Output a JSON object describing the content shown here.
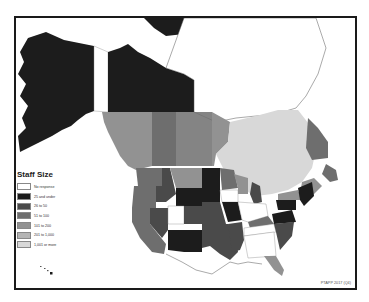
{
  "map": {
    "title": "Staff Size",
    "region": "North America (United States and Canada)",
    "credit": "PTAPP 2017 (Q4)"
  },
  "legend": {
    "title": "Staff Size",
    "items": [
      {
        "label": "No response",
        "color": "#ffffff"
      },
      {
        "label": "25 and under",
        "color": "#1c1c1c"
      },
      {
        "label": "26 to 50",
        "color": "#4a4a4a"
      },
      {
        "label": "51 to 100",
        "color": "#6e6e6e"
      },
      {
        "label": "101 to 200",
        "color": "#929292"
      },
      {
        "label": "201 to 1,000",
        "color": "#b4b4b4"
      },
      {
        "label": "1,001 or more",
        "color": "#d8d8d8"
      }
    ]
  },
  "colors": {
    "frame": "#1a1a1a",
    "coastline": "#555555",
    "background": "#ffffff"
  }
}
